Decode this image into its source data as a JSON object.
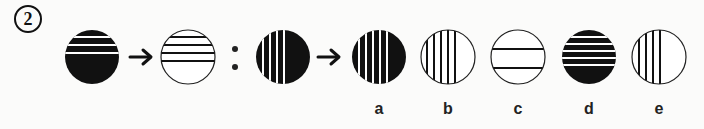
{
  "question": {
    "number": "2",
    "description": "Figure analogy: circle pattern A transforms to B as C transforms to ?",
    "stem": [
      {
        "id": "figure-1",
        "fill": "black",
        "line_color": "white",
        "orientation": "horizontal",
        "line_count": 3,
        "lines_region": "upper"
      },
      {
        "id": "figure-2",
        "fill": "white",
        "line_color": "black",
        "orientation": "horizontal",
        "line_count": 4,
        "lines_region": "upper"
      },
      {
        "id": "figure-3",
        "fill": "black",
        "line_color": "white",
        "orientation": "vertical",
        "line_count": 4,
        "lines_region": "left"
      }
    ],
    "separator": ":",
    "arrow": "→",
    "options": [
      {
        "label": "a",
        "fill": "black",
        "line_color": "white",
        "orientation": "vertical",
        "line_count": 5
      },
      {
        "label": "b",
        "fill": "white",
        "line_color": "black",
        "orientation": "vertical",
        "line_count": 5
      },
      {
        "label": "c",
        "fill": "white",
        "line_color": "black",
        "orientation": "horizontal",
        "line_count": 2
      },
      {
        "label": "d",
        "fill": "black",
        "line_color": "white",
        "orientation": "horizontal",
        "line_count": 5
      },
      {
        "label": "e",
        "fill": "white",
        "line_color": "black",
        "orientation": "vertical",
        "line_count": 4
      }
    ]
  },
  "colors": {
    "ink": "#111111",
    "background": "#fbfbfa"
  }
}
